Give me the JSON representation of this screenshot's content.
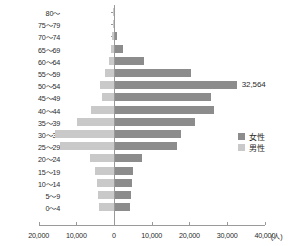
{
  "chart_data": {
    "type": "bar",
    "subtype": "population-pyramid",
    "title": "",
    "xlabel": "",
    "ylabel": "",
    "unit_label": "(人)",
    "grid": false,
    "legend_position": "right-middle",
    "orientation": "horizontal",
    "xlim": [
      -20000,
      40000
    ],
    "xticks": [
      -20000,
      -10000,
      0,
      10000,
      20000,
      30000,
      40000
    ],
    "xticklabels": [
      "20,000",
      "10,000",
      "0",
      "10,000",
      "20,000",
      "30,000",
      "40,000"
    ],
    "categories": [
      "80～",
      "75～79",
      "70～74",
      "65～69",
      "60～64",
      "55～59",
      "50～54",
      "45～49",
      "40～44",
      "35～39",
      "30～34",
      "25～29",
      "20～24",
      "15～19",
      "10～14",
      "5～9",
      "0～4"
    ],
    "series": [
      {
        "name": "女性",
        "color": "#8c8c8c",
        "direction": "right",
        "values": [
          120,
          330,
          900,
          2300,
          7900,
          20300,
          32564,
          25800,
          26400,
          21400,
          17900,
          16800,
          7400,
          5100,
          4900,
          4500,
          4200
        ]
      },
      {
        "name": "男性",
        "color": "#c9c9c9",
        "direction": "left",
        "values": [
          60,
          180,
          500,
          900,
          1300,
          2400,
          3600,
          3200,
          6100,
          9800,
          15600,
          14300,
          6300,
          5000,
          4400,
          4300,
          4000
        ]
      }
    ],
    "annotations": [
      {
        "text": "32,564",
        "category": "50～54",
        "series": "女性"
      }
    ]
  },
  "legend": {
    "items": [
      {
        "label": "女性",
        "color": "#8c8c8c"
      },
      {
        "label": "男性",
        "color": "#c9c9c9"
      }
    ]
  },
  "axis": {
    "unit": "(人)"
  }
}
